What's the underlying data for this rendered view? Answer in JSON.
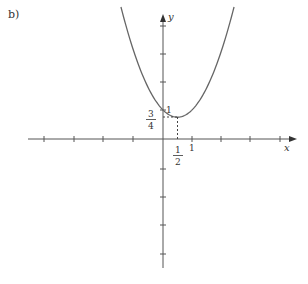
{
  "figure": {
    "part_label": "b)",
    "x_axis_label": "x",
    "y_axis_label": "y",
    "vertex_x_label": {
      "num": "1",
      "den": "2"
    },
    "vertex_y_label": {
      "num": "3",
      "den": "4"
    },
    "y_intercept_label": "1",
    "x_one_label": "1"
  },
  "chart_data": {
    "type": "line",
    "title": "",
    "function": "y = x^2 - x + 1",
    "series": [
      {
        "name": "parabola",
        "x": [
          -1.45,
          -1,
          -0.5,
          0,
          0.5,
          1,
          1.5,
          2,
          2.45
        ],
        "y": [
          4.55,
          3,
          1.75,
          1,
          0.75,
          1,
          1.75,
          3,
          4.55
        ]
      }
    ],
    "annotations": [
      {
        "type": "point",
        "label": "1",
        "x": 0,
        "y": 1
      },
      {
        "type": "dashed-guide",
        "label": "1/2",
        "x": 0.5,
        "y": 0.75
      },
      {
        "type": "tick-label",
        "label": "3/4",
        "axis": "y",
        "value": 0.75
      },
      {
        "type": "tick-label",
        "label": "1",
        "axis": "x",
        "value": 1
      }
    ],
    "xlabel": "x",
    "ylabel": "y",
    "xlim": [
      -4.3,
      4.5
    ],
    "ylim": [
      -4.5,
      4.3
    ],
    "x_ticks": [
      -4,
      -3,
      -2,
      -1,
      1,
      2,
      3,
      4
    ],
    "y_ticks": [
      -4,
      -3,
      -2,
      -1,
      1,
      2,
      3,
      4
    ],
    "grid": false,
    "legend": "none"
  }
}
